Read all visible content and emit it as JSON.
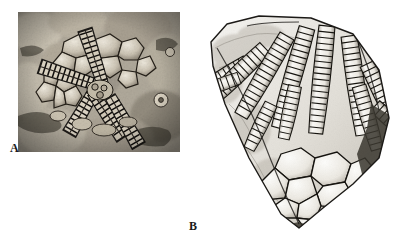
{
  "figure": {
    "background_color": "#ffffff",
    "width": 420,
    "height": 245,
    "kind": "two-panel paleontological figure plate"
  },
  "panels": [
    {
      "id": "A",
      "label": "A",
      "label_position": "lower-left",
      "frame": "rectangular photographic plate",
      "bounds": {
        "x": 18,
        "y": 12,
        "width": 162,
        "height": 140
      },
      "subject": "pentaradial echinoderm (crinoid / edrioasteroid) fossil preserved in rock matrix",
      "description": "Five-fold radiating segmented ambulacral arms with ladder-like transverse plates, surrounded by irregular polygonal interambulacral plates, set in a mottled limestone matrix",
      "media": "grayscale photograph",
      "tones": {
        "matrix_light": "#c9c2b4",
        "matrix_mid": "#9a9384",
        "matrix_dark": "#4a453d",
        "plate_highlight": "#e8e3d8",
        "groove_shadow": "#1c1a17"
      },
      "arm_count": 5
    },
    {
      "id": "B",
      "label": "B",
      "label_position": "below-center",
      "frame": "irregular specimen silhouette, no border",
      "bounds": {
        "x": 203,
        "y": 8,
        "width": 192,
        "height": 228
      },
      "subject": "crinoid calyx with radiating segmented arms and polygonal basal plate circlet",
      "description": "Wedge-shaped rock slab bearing numerous closely packed segmented arms fanning from upper left toward lower right, terminating at a rosette of large smooth polygonal calyx plates at the base",
      "media": "high-contrast grayscale photograph / line rendering",
      "tones": {
        "specimen_light": "#f2f0ec",
        "specimen_mid": "#bdb9b1",
        "specimen_dark": "#2b2926",
        "outline": "#111111"
      },
      "arm_count": 12
    }
  ],
  "labels": {
    "a": "A",
    "b": "B"
  }
}
